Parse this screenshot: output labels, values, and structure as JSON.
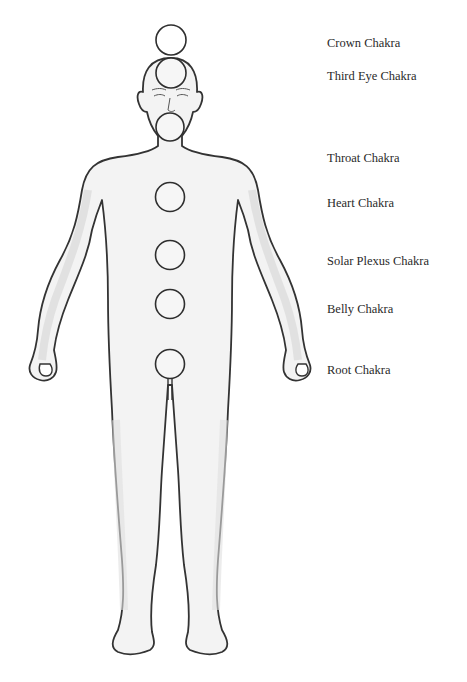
{
  "diagram": {
    "outline_color": "#333333",
    "fill_color": "#f2f2f2",
    "shade_color": "#d4d4d4",
    "chakras": [
      {
        "name": "Crown Chakra",
        "cx": 171,
        "cy": 40,
        "label_y": 36
      },
      {
        "name": "Third Eye Chakra",
        "cx": 171,
        "cy": 73,
        "label_y": 69
      },
      {
        "name": "Throat Chakra",
        "cx": 170,
        "cy": 127,
        "label_y": 151
      },
      {
        "name": "Heart Chakra",
        "cx": 170,
        "cy": 197,
        "label_y": 196
      },
      {
        "name": "Solar Plexus Chakra",
        "cx": 170,
        "cy": 255,
        "label_y": 254
      },
      {
        "name": "Belly Chakra",
        "cx": 170,
        "cy": 304,
        "label_y": 302
      },
      {
        "name": "Root Chakra",
        "cx": 170,
        "cy": 364,
        "label_y": 363
      }
    ],
    "chakra_radius": 15
  }
}
